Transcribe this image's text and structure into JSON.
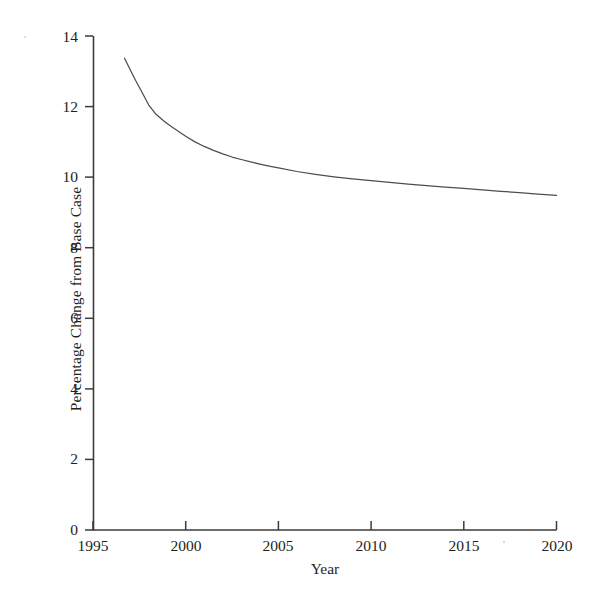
{
  "chart_data": {
    "type": "line",
    "title": "",
    "xlabel": "Year",
    "ylabel": "Percentage Change from Base Case",
    "xlim": [
      1995,
      2020
    ],
    "ylim": [
      0,
      14
    ],
    "xticks": [
      1995,
      2000,
      2005,
      2010,
      2015,
      2020
    ],
    "xtick_labels": [
      "1995",
      "2000",
      "2005",
      "2010",
      "2015",
      "2020"
    ],
    "yticks": [
      0,
      2,
      4,
      6,
      8,
      10,
      12,
      14
    ],
    "ytick_labels": [
      "0",
      "2",
      "4",
      "6",
      "8",
      "10",
      "12",
      "14"
    ],
    "grid": false,
    "legend": null,
    "series": [
      {
        "name": "Percentage change from base case",
        "color": "#4d4d4d",
        "x": [
          1996.7,
          1997.0,
          1997.3,
          1997.6,
          1998.0,
          1998.4,
          1998.8,
          1999.2,
          1999.6,
          2000.0,
          2000.5,
          2001.0,
          2001.5,
          2002.0,
          2002.5,
          2003.0,
          2003.5,
          2004.0,
          2004.5,
          2005.0,
          2006.0,
          2007.0,
          2008.0,
          2009.0,
          2010.0,
          2011.0,
          2012.0,
          2013.0,
          2014.0,
          2015.0,
          2016.0,
          2017.0,
          2018.0,
          2019.0,
          2020.0
        ],
        "y": [
          13.37,
          13.05,
          12.74,
          12.45,
          12.05,
          11.78,
          11.6,
          11.44,
          11.3,
          11.16,
          11.0,
          10.87,
          10.76,
          10.66,
          10.57,
          10.5,
          10.43,
          10.37,
          10.31,
          10.26,
          10.16,
          10.08,
          10.01,
          9.95,
          9.9,
          9.85,
          9.8,
          9.76,
          9.72,
          9.68,
          9.64,
          9.6,
          9.56,
          9.52,
          9.48
        ]
      }
    ]
  },
  "axis": {
    "ylabel": "Percentage Change from Base Case",
    "xlabel": "Year",
    "ytick_labels": [
      "14",
      "12",
      "10",
      "8",
      "6",
      "4",
      "2",
      "0"
    ],
    "xtick_labels": [
      "1995",
      "2000",
      "2005",
      "2010",
      "2015",
      "2020"
    ]
  }
}
